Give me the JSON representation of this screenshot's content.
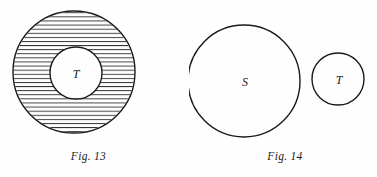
{
  "page": {
    "background_color": "#fefefe",
    "ink_color": "#1a1a1a",
    "width": 377,
    "height": 177
  },
  "figures": [
    {
      "id": "fig-13",
      "caption": "Fig. 13",
      "description": "Large circle with hatched annulus surrounding an unhatched inner circle labelled T",
      "shapes": [
        {
          "name": "outer-circle",
          "label": "",
          "cx": 74,
          "cy": 72,
          "r": 61,
          "fill": "none",
          "stroke": "#1a1a1a",
          "stroke_width": 1.4,
          "hatched": true,
          "hatch_spacing": 4.1,
          "hatch_angle_deg": 0
        },
        {
          "name": "inner-circle",
          "label": "T",
          "cx": 76,
          "cy": 73,
          "r": 26,
          "fill": "#fefefe",
          "stroke": "#1a1a1a",
          "stroke_width": 1.4,
          "hatched": false,
          "label_x": 76,
          "label_y": 78,
          "label_size": 12
        }
      ]
    },
    {
      "id": "fig-14",
      "caption": "Fig. 14",
      "description": "Two disjoint circles, a large one labelled S and a small one labelled T",
      "shapes": [
        {
          "name": "s-circle",
          "label": "S",
          "cx": 55,
          "cy": 81,
          "r": 56,
          "fill": "none",
          "stroke": "#1a1a1a",
          "stroke_width": 1.4,
          "hatched": false,
          "label_x": 56,
          "label_y": 86,
          "label_size": 12
        },
        {
          "name": "t-circle",
          "label": "T",
          "cx": 149,
          "cy": 79,
          "r": 26,
          "fill": "none",
          "stroke": "#1a1a1a",
          "stroke_width": 1.4,
          "hatched": false,
          "label_x": 150,
          "label_y": 84,
          "label_size": 12
        }
      ]
    }
  ]
}
